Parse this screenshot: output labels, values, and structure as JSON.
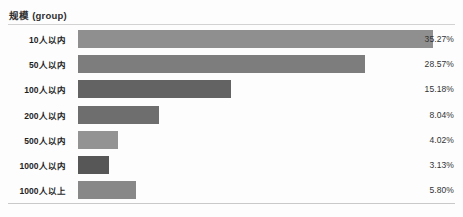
{
  "chart_data": {
    "type": "bar",
    "orientation": "horizontal",
    "title": "规模 (group)",
    "xlabel": "",
    "ylabel": "",
    "grid": false,
    "legend": "none",
    "xlim": [
      0,
      37.5
    ],
    "categories": [
      "10人以内",
      "50人以内",
      "100人以内",
      "200人以内",
      "500人以内",
      "1000人以内",
      "1000人以上"
    ],
    "values": [
      35.27,
      28.57,
      15.18,
      8.04,
      4.02,
      3.13,
      5.8
    ],
    "value_labels": [
      "35.27%",
      "28.57%",
      "15.18%",
      "8.04%",
      "4.02%",
      "3.13%",
      "5.80%"
    ],
    "bar_colors": [
      "#8f8f8f",
      "#7d7d7d",
      "#636363",
      "#6e6e6e",
      "#939393",
      "#575757",
      "#888888"
    ]
  },
  "chart": {
    "title": "规模 (group)",
    "rows": [
      {
        "label": "10人以内",
        "value": "35.27%"
      },
      {
        "label": "50人以内",
        "value": "28.57%"
      },
      {
        "label": "100人以内",
        "value": "15.18%"
      },
      {
        "label": "200人以内",
        "value": "8.04%"
      },
      {
        "label": "500人以内",
        "value": "4.02%"
      },
      {
        "label": "1000人以内",
        "value": "3.13%"
      },
      {
        "label": "1000人以上",
        "value": "5.80%"
      }
    ]
  }
}
